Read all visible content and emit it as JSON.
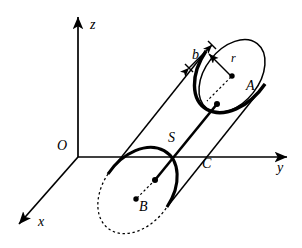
{
  "figure": {
    "kind": "3d-cylinder-coordinate-diagram",
    "background_color": "#ffffff",
    "stroke_color": "#000000",
    "width": 302,
    "height": 248
  },
  "axes": {
    "origin_label": "O",
    "z_label": "z",
    "y_label": "y",
    "x_label": "x",
    "origin_point": [
      78,
      157
    ],
    "z_tip": [
      78,
      12
    ],
    "y_tip": [
      292,
      157
    ],
    "x_tip": [
      14,
      228
    ]
  },
  "cylinder": {
    "top_face_center_label": "A",
    "bottom_face_center_label": "B",
    "axis_segment_label": "S",
    "body_label": "C",
    "radius_label": "r",
    "thickness_label": "b",
    "top_center_point": [
      232,
      76
    ],
    "bottom_center_point": [
      136,
      199
    ],
    "axis_top_point": [
      217,
      104
    ],
    "axis_bottom_point": [
      155,
      180
    ]
  },
  "labels": [
    {
      "name": "axis-label-z",
      "text": "z",
      "x": 90,
      "y": 18
    },
    {
      "name": "axis-label-y",
      "text": "y",
      "x": 277,
      "y": 168
    },
    {
      "name": "axis-label-x",
      "text": "x",
      "x": 38,
      "y": 222
    },
    {
      "name": "axis-label-origin",
      "text": "O",
      "x": 58,
      "y": 146
    },
    {
      "name": "thickness-label-b",
      "text": "b",
      "x": 193,
      "y": 55
    },
    {
      "name": "radius-label-r",
      "text": "r",
      "x": 231,
      "y": 59
    },
    {
      "name": "point-label-A",
      "text": "A",
      "x": 247,
      "y": 85
    },
    {
      "name": "point-label-B",
      "text": "B",
      "x": 140,
      "y": 205
    },
    {
      "name": "axis-segment-label-S",
      "text": "S",
      "x": 169,
      "y": 137
    },
    {
      "name": "body-label-C",
      "text": "C",
      "x": 203,
      "y": 163
    }
  ]
}
